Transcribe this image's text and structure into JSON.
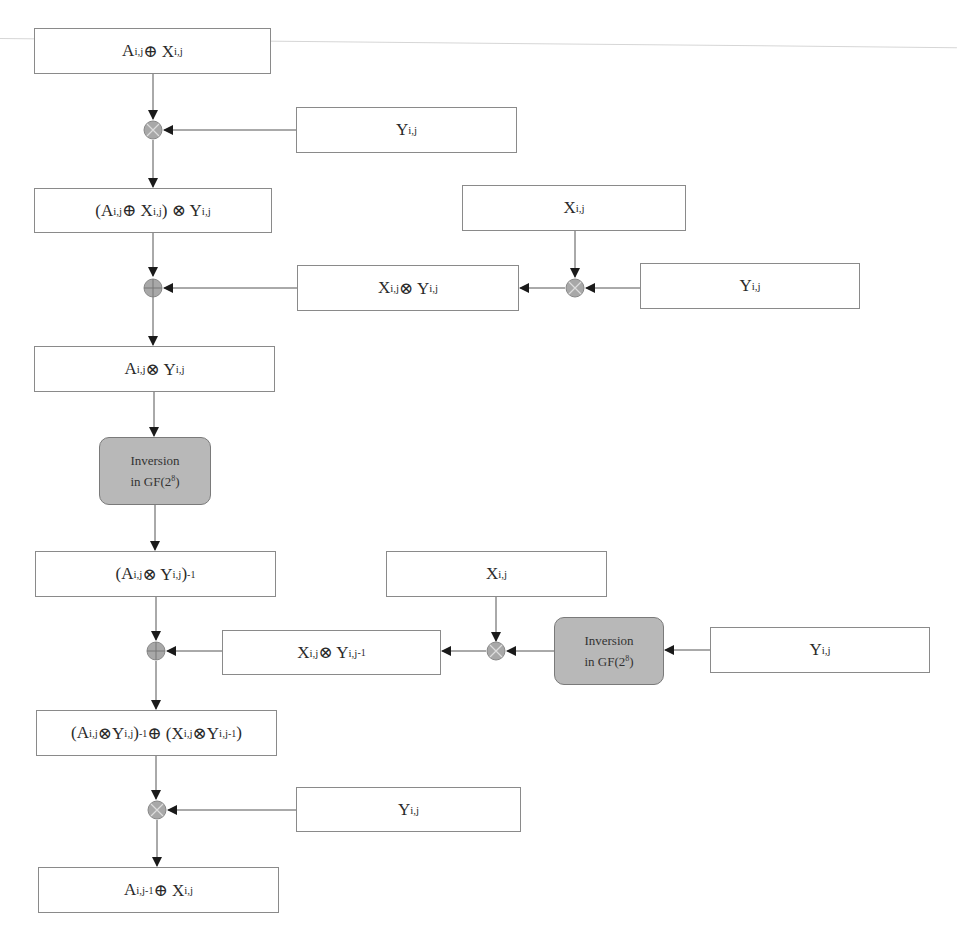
{
  "diagram": {
    "type": "flowchart",
    "main_column": [
      {
        "id": "b1",
        "label": "A<sub>i,j</sub> ⊕ X<sub>i,j</sub>"
      },
      {
        "id": "b2",
        "label": "(A<sub>i,j</sub> ⊕ X<sub>i,j</sub>) ⊗ Y<sub>i,j</sub>"
      },
      {
        "id": "b3",
        "label": "A<sub>i,j</sub> ⊗ Y<sub>i,j</sub>"
      },
      {
        "id": "inv1",
        "label_line1": "Inversion",
        "label_line2": "in GF(2<sup>8</sup>)"
      },
      {
        "id": "b4",
        "label": "(A<sub>i,j</sub> ⊗ Y<sub>i,j</sub>)<sup> -1</sup>"
      },
      {
        "id": "b5",
        "label": "(A<sub>i,j</sub>⊗Y<sub>i,j</sub>)<sup>-1</sup> ⊕ (X<sub>i,j</sub>⊗Y<sub>i,j</sub><sup>-1</sup>)"
      },
      {
        "id": "b6",
        "label": "A<sub>i,j</sub><sup>-1</sup> ⊕ X<sub>i,j</sub>"
      }
    ],
    "side_inputs": [
      {
        "id": "y1",
        "label": "Y<sub>i,j</sub>"
      },
      {
        "id": "x1",
        "label": "X<sub>i,j</sub>"
      },
      {
        "id": "xy1",
        "label": "X<sub>i,j</sub> ⊗ Y<sub>i,j</sub>"
      },
      {
        "id": "y2",
        "label": "Y<sub>i,j</sub>"
      },
      {
        "id": "x2",
        "label": "X<sub>i,j</sub>"
      },
      {
        "id": "xy2",
        "label": "X<sub>i,j</sub> ⊗ Y<sub>i,j</sub><sup>-1</sup>"
      },
      {
        "id": "inv2",
        "label_line1": "Inversion",
        "label_line2": "in GF(2<sup>8</sup>)"
      },
      {
        "id": "y3",
        "label": "Y<sub>i,j</sub>"
      },
      {
        "id": "y4",
        "label": "Y<sub>i,j</sub>"
      }
    ],
    "operators": [
      {
        "id": "op1",
        "symbol": "⊗",
        "name": "multiply"
      },
      {
        "id": "op2",
        "symbol": "⊕",
        "name": "xor"
      },
      {
        "id": "op3",
        "symbol": "⊗",
        "name": "multiply"
      },
      {
        "id": "op4",
        "symbol": "⊕",
        "name": "xor"
      },
      {
        "id": "op5",
        "symbol": "⊗",
        "name": "multiply"
      },
      {
        "id": "op6",
        "symbol": "⊗",
        "name": "multiply"
      }
    ],
    "colors": {
      "box_border": "#8a8a8a",
      "inversion_fill": "#b8b8b8",
      "operator_fill": "#a8a8a8",
      "line": "#555555"
    }
  }
}
